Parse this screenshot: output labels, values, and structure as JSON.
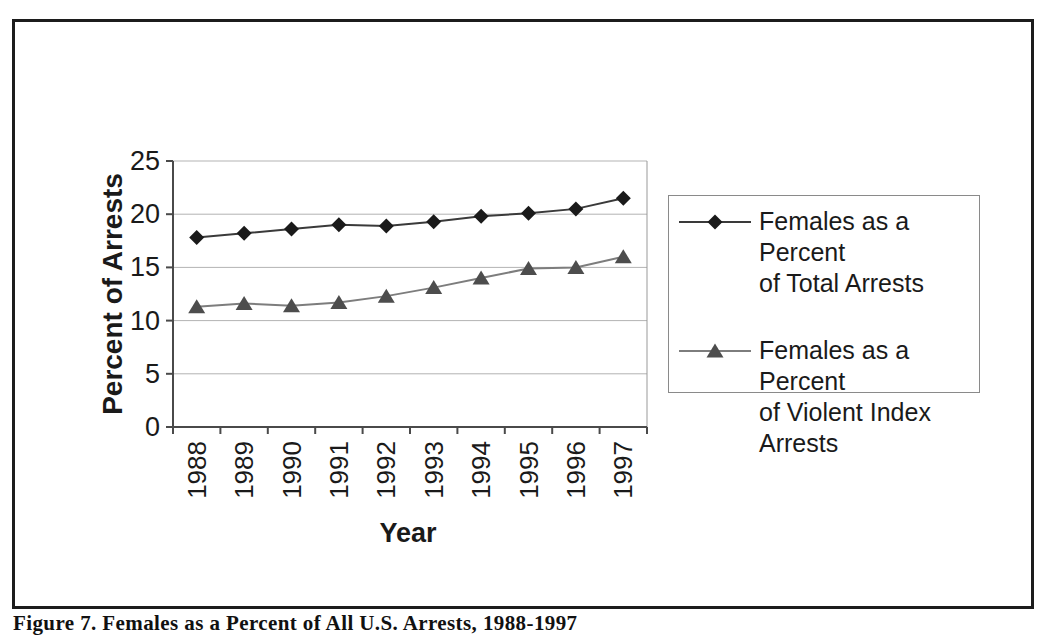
{
  "figure": {
    "caption": "Figure 7. Females as a Percent of All U.S. Arrests, 1988-1997"
  },
  "chart_data": {
    "type": "line",
    "title": "",
    "xlabel": "Year",
    "ylabel": "Percent of Arrests",
    "ylim": [
      0,
      25
    ],
    "yticks": [
      0,
      5,
      10,
      15,
      20,
      25
    ],
    "grid": true,
    "legend_position": "right",
    "categories": [
      "1988",
      "1989",
      "1990",
      "1991",
      "1992",
      "1993",
      "1994",
      "1995",
      "1996",
      "1997"
    ],
    "series": [
      {
        "name": "Females as a Percent of Total Arrests",
        "marker": "diamond",
        "marker_color": "#1a1a1a",
        "line_color": "#3a3a3a",
        "values": [
          17.8,
          18.2,
          18.6,
          19.0,
          18.9,
          19.3,
          19.8,
          20.1,
          20.5,
          21.5
        ]
      },
      {
        "name": "Females as a Percent of Violent Index Arrests",
        "marker": "triangle",
        "marker_color": "#4d4d4d",
        "line_color": "#7d7d7d",
        "values": [
          11.3,
          11.6,
          11.4,
          11.7,
          12.3,
          13.1,
          14.0,
          14.9,
          15.0,
          16.0
        ]
      }
    ],
    "colors": {
      "gridline": "#b3b3b3",
      "axis": "#4a4a4a",
      "plot_border": "#999999",
      "text": "#1a1a1a"
    }
  },
  "legend": {
    "items": [
      {
        "label": "Females as a Percent\nof Total Arrests",
        "marker": "diamond"
      },
      {
        "label": "Females as a Percent\nof Violent Index\nArrests",
        "marker": "triangle"
      }
    ]
  }
}
